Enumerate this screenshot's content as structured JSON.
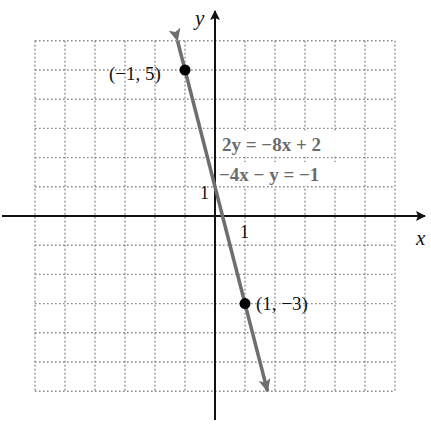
{
  "chart_data": {
    "type": "line",
    "title": "",
    "xlabel": "x",
    "ylabel": "y",
    "xlim": [
      -6,
      6
    ],
    "ylim": [
      -6,
      6
    ],
    "grid": true,
    "grid_style": "dotted",
    "tick_labels": {
      "x": [
        "1"
      ],
      "y": [
        "1"
      ]
    },
    "series": [
      {
        "name": "2y = -8x + 2 / -4x - y = -1",
        "equation_slope_intercept": "y = -4x + 1",
        "slope": -4,
        "intercept": 1,
        "x": [
          -1.25,
          1.75
        ],
        "y": [
          6,
          -6
        ],
        "arrows": "both",
        "color": "#6e6e6e"
      }
    ],
    "points": [
      {
        "x": -1,
        "y": 5,
        "label": "(−1, 5)"
      },
      {
        "x": 1,
        "y": -3,
        "label": "(1, −3)"
      }
    ],
    "annotations": [
      {
        "text": "2y = −8x + 2",
        "at": [
          1,
          2.5
        ]
      },
      {
        "text": "−4x − y = −1",
        "at": [
          1,
          1.5
        ]
      }
    ]
  },
  "labels": {
    "x_axis": "x",
    "y_axis": "y",
    "x_tick_one": "1",
    "y_tick_one": "1",
    "point_a": "(−1, 5)",
    "point_b": "(1, −3)",
    "equation_1": "2y = −8x + 2",
    "equation_2": "−4x − y = −1"
  },
  "colors": {
    "axis": "#111111",
    "grid": "#8a8a8a",
    "line": "#6e6e6e",
    "point": "#000000",
    "equation_text": "#6b6b6b"
  }
}
